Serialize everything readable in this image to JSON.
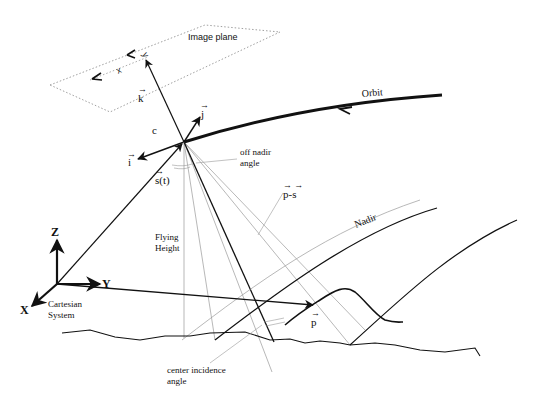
{
  "diagram": {
    "type": "satellite imaging geometry",
    "labels": {
      "image_plane": "Image plane",
      "image_x": "x",
      "image_y": "y",
      "orbit": "Orbit",
      "k_vec": "k",
      "j_vec": "j",
      "i_vec": "i",
      "c": "c",
      "s_t": "s(t)",
      "off_nadir_1": "off nadir",
      "off_nadir_2": "angle",
      "p_minus_s": "p-s",
      "nadir": "Nadir",
      "flying_1": "Flying",
      "flying_2": "Height",
      "axis_z": "Z",
      "axis_y": "Y",
      "axis_x": "X",
      "cartesian_1": "Cartesian",
      "cartesian_2": "System",
      "p_vec": "p",
      "center_incidence_1": "center incidence",
      "center_incidence_2": "angle"
    },
    "colors": {
      "ink": "#111111",
      "light_line": "#999999",
      "dotted": "#888888",
      "background": "#ffffff"
    }
  }
}
